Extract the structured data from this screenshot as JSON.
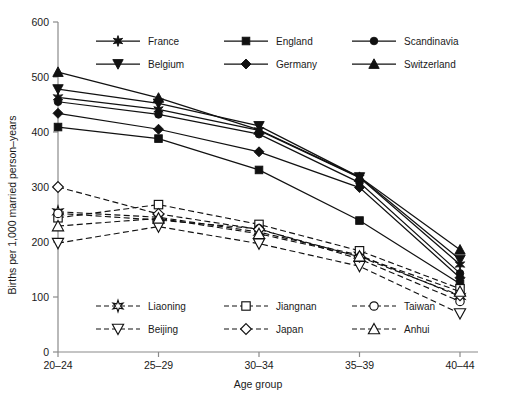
{
  "chart_data": {
    "type": "line",
    "title": "",
    "xlabel": "Age group",
    "ylabel": "Births per 1,000 married person–years",
    "categories": [
      "20–24",
      "25–29",
      "30–34",
      "35–39",
      "40–44"
    ],
    "ylim": [
      0,
      600
    ],
    "yticks": [
      0,
      100,
      200,
      300,
      400,
      500,
      600
    ],
    "grid": false,
    "legend_position": "inside-top and inside-bottom",
    "series": [
      {
        "name": "France",
        "marker": "star-filled",
        "line": "solid",
        "group": "europe",
        "values": [
          463,
          441,
          403,
          317,
          159
        ]
      },
      {
        "name": "England",
        "marker": "square-filled",
        "line": "solid",
        "group": "europe",
        "values": [
          409,
          388,
          331,
          239,
          124
        ]
      },
      {
        "name": "Scandinavia",
        "marker": "circle-filled",
        "line": "solid",
        "group": "europe",
        "values": [
          455,
          432,
          396,
          308,
          143
        ]
      },
      {
        "name": "Belgium",
        "marker": "triangle-down-filled",
        "line": "solid",
        "group": "europe",
        "values": [
          478,
          452,
          411,
          318,
          168
        ]
      },
      {
        "name": "Germany",
        "marker": "diamond-filled",
        "line": "solid",
        "group": "europe",
        "values": [
          434,
          405,
          364,
          299,
          135
        ]
      },
      {
        "name": "Switzerland",
        "marker": "triangle-up-filled",
        "line": "solid",
        "group": "europe",
        "values": [
          509,
          462,
          404,
          318,
          186
        ]
      },
      {
        "name": "Liaoning",
        "marker": "star-open",
        "line": "dashed",
        "group": "asia",
        "values": [
          255,
          245,
          218,
          176,
          101
        ]
      },
      {
        "name": "Jiangnan",
        "marker": "square-open",
        "line": "dashed",
        "group": "asia",
        "values": [
          244,
          268,
          232,
          184,
          115
        ]
      },
      {
        "name": "Taiwan",
        "marker": "circle-open",
        "line": "dashed",
        "group": "asia",
        "values": [
          252,
          240,
          224,
          169,
          92
        ]
      },
      {
        "name": "Beijing",
        "marker": "triangle-down-open",
        "line": "dashed",
        "group": "asia",
        "values": [
          198,
          228,
          197,
          156,
          70
        ]
      },
      {
        "name": "Japan",
        "marker": "diamond-open",
        "line": "dashed",
        "group": "asia",
        "values": [
          300,
          251,
          223,
          173,
          103
        ]
      },
      {
        "name": "Anhui",
        "marker": "triangle-up-open",
        "line": "dashed",
        "group": "asia",
        "values": [
          229,
          243,
          215,
          174,
          110
        ]
      }
    ]
  },
  "legend_top": {
    "items": [
      {
        "label": "France",
        "marker": "star-filled",
        "line": "solid"
      },
      {
        "label": "England",
        "marker": "square-filled",
        "line": "solid"
      },
      {
        "label": "Scandinavia",
        "marker": "circle-filled",
        "line": "solid"
      },
      {
        "label": "Belgium",
        "marker": "triangle-down-filled",
        "line": "solid"
      },
      {
        "label": "Germany",
        "marker": "diamond-filled",
        "line": "solid"
      },
      {
        "label": "Switzerland",
        "marker": "triangle-up-filled",
        "line": "solid"
      }
    ]
  },
  "legend_bottom": {
    "items": [
      {
        "label": "Liaoning",
        "marker": "star-open",
        "line": "dashed"
      },
      {
        "label": "Jiangnan",
        "marker": "square-open",
        "line": "dashed"
      },
      {
        "label": "Taiwan",
        "marker": "circle-open",
        "line": "dashed"
      },
      {
        "label": "Beijing",
        "marker": "triangle-down-open",
        "line": "dashed"
      },
      {
        "label": "Japan",
        "marker": "diamond-open",
        "line": "dashed"
      },
      {
        "label": "Anhui",
        "marker": "triangle-up-open",
        "line": "dashed"
      }
    ]
  },
  "colors": {
    "ink": "#111111",
    "axis": "#8a8a8a",
    "background": "#ffffff"
  }
}
